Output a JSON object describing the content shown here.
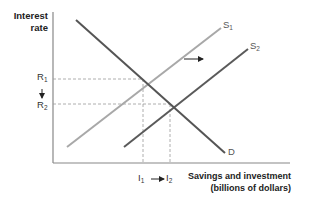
{
  "diagram": {
    "y_axis": {
      "line1": "Interest",
      "line2": "rate"
    },
    "x_axis": {
      "line1": "Savings and investment",
      "line2": "(billions of dollars)"
    },
    "curves": {
      "s1": {
        "base": "S",
        "sub": "1",
        "color": "#a8a8a8"
      },
      "s2": {
        "base": "S",
        "sub": "2",
        "color": "#5a5a5a"
      },
      "d": {
        "base": "D",
        "color": "#555555"
      }
    },
    "y_ticks": {
      "r1": {
        "base": "R",
        "sub": "1"
      },
      "r2": {
        "base": "R",
        "sub": "2"
      }
    },
    "x_ticks": {
      "i1": {
        "base": "I",
        "sub": "1"
      },
      "i2": {
        "base": "I",
        "sub": "2"
      }
    },
    "arrows": {
      "rate_down": "↓",
      "quantity_right": "⟶",
      "supply_shift": "→"
    }
  }
}
